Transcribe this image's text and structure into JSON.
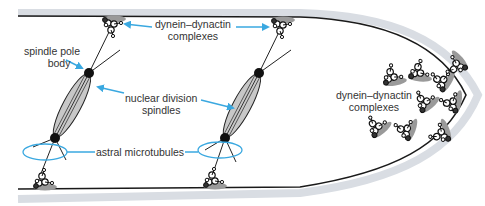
{
  "diagram": {
    "colors": {
      "membrane": "#1a1a1a",
      "cell_wall": "#d9dde3",
      "spindle_fill": "#c8c8c8",
      "motor_fill": "#9a9a9a",
      "arrow": "#3aa8e0",
      "ring": "#3aa8e0",
      "text": "#333333"
    },
    "labels": {
      "dd_top_line1": "dynein–dynactin",
      "dd_top_line2": "complexes",
      "spb_line1": "spindle pole",
      "spb_line2": "body",
      "nds_line1": "nuclear division",
      "nds_line2": "spindles",
      "astral": "astral microtubules",
      "dd_tip_line1": "dynein–dynactin",
      "dd_tip_line2": "complexes"
    },
    "components": [
      {
        "name": "plasma membrane / cell wall",
        "shape": "hyphal tube with rounded tip"
      },
      {
        "name": "spindle 1",
        "poles": [
          [
            89,
            73
          ],
          [
            55,
            138
          ]
        ]
      },
      {
        "name": "spindle 2",
        "poles": [
          [
            259,
            73
          ],
          [
            225,
            138
          ]
        ]
      },
      {
        "name": "cortical dynein-dynactin (top)",
        "positions": [
          [
            110,
            22
          ],
          [
            280,
            22
          ]
        ]
      },
      {
        "name": "cortical dynein-dynactin (bottom)",
        "positions": [
          [
            42,
            182
          ],
          [
            212,
            182
          ]
        ]
      },
      {
        "name": "tip cluster dynein-dynactin",
        "count": 9
      }
    ]
  }
}
